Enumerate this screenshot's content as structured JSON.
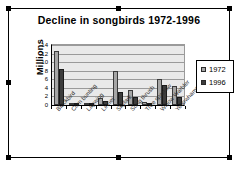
{
  "chart_data": {
    "type": "bar",
    "title": "Decline in songbirds 1972-1996",
    "xlabel": "",
    "ylabel": "Millions",
    "ylim": [
      0,
      14
    ],
    "yticks": [
      14,
      12,
      10,
      8,
      6,
      4,
      2,
      0
    ],
    "grid": true,
    "legend_position": "right",
    "categories": [
      "Blackbird",
      "Corn bunting",
      "Lapwing",
      "Linnet",
      "Skylark",
      "Song thrush",
      "Tree sparrow",
      "Willow Warbler",
      "Yellowhammer"
    ],
    "series": [
      {
        "name": "1972",
        "color": "#a6a6a6",
        "values": [
          12.5,
          0.2,
          0.5,
          1.6,
          8.0,
          3.6,
          0.6,
          6.0,
          4.4
        ]
      },
      {
        "name": "1996",
        "color": "#3d3d3d",
        "values": [
          8.4,
          0.1,
          0.4,
          0.9,
          3.1,
          1.9,
          0.1,
          4.6,
          1.9
        ]
      }
    ]
  },
  "legend": {
    "items": [
      {
        "label": "1972"
      },
      {
        "label": "1996"
      }
    ]
  },
  "object": {
    "selected": true
  }
}
